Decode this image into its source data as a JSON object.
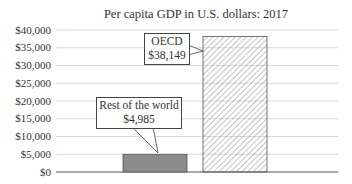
{
  "chart_data": {
    "type": "bar",
    "title": "Per capita GDP in U.S. dollars: 2017",
    "xlabel": "",
    "ylabel": "",
    "categories": [
      "Rest of the world",
      "OECD"
    ],
    "values": [
      4985,
      38149
    ],
    "value_labels": [
      "$4,985",
      "$38,149"
    ],
    "bar_styles": [
      "solid-gray",
      "hatched"
    ],
    "ylim": [
      0,
      40000
    ],
    "yticks": [
      0,
      5000,
      10000,
      15000,
      20000,
      25000,
      30000,
      35000,
      40000
    ],
    "ytick_labels": [
      "$0",
      "$5,000",
      "$10,000",
      "$15,000",
      "$20,000",
      "$25,000",
      "$30,000",
      "$35,000",
      "$40,000"
    ],
    "grid": true,
    "legend": "none",
    "annotations": [
      {
        "target": "Rest of the world",
        "line1": "Rest of the world",
        "line2": "$4,985"
      },
      {
        "target": "OECD",
        "line1": "OECD",
        "line2": "$38,149"
      }
    ]
  },
  "colors": {
    "rest_bar": "#8c8c8c",
    "oecd_hatch": "#888888",
    "grid": "#d0d0d0",
    "axis": "#555555"
  }
}
